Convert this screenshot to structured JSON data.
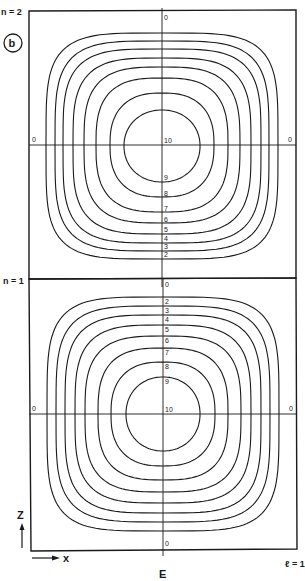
{
  "panel_label": "b",
  "figure_caption": "E",
  "mode_labels": {
    "top": "n = 2",
    "middle": "n = 1",
    "right_bottom": "ℓ = 1"
  },
  "axes": {
    "vertical": "Z",
    "horizontal": "x"
  },
  "line_color": "#1a1a1a",
  "background_color": "#ffffff",
  "cells": [
    {
      "id": "n2",
      "boundary_labels": {
        "top": "0",
        "left": "0",
        "right": "0"
      },
      "center_label": "10",
      "contour_levels": [
        "9",
        "8",
        "7",
        "6",
        "5",
        "4",
        "3",
        "2"
      ],
      "label_side": "below"
    },
    {
      "id": "n1",
      "boundary_labels": {
        "top": "0",
        "left": "0",
        "right": "0",
        "bottom": "0"
      },
      "center_label": "10",
      "contour_levels": [
        "9",
        "8",
        "7",
        "6",
        "5",
        "4",
        "3",
        "2"
      ],
      "label_side": "above"
    }
  ]
}
